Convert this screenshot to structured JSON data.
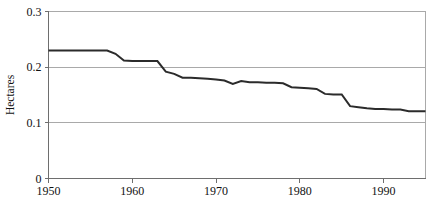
{
  "chart_data": {
    "type": "line",
    "title": "",
    "subtitle": "",
    "xlabel": "",
    "ylabel": "Hectares",
    "xlim": [
      1950,
      1995
    ],
    "ylim": [
      0,
      0.3
    ],
    "grid": true,
    "grid_axis": "y",
    "legend": false,
    "legend_position": "none",
    "xticks": [
      1950,
      1960,
      1970,
      1980,
      1990
    ],
    "xtick_labels": [
      "1950",
      "1960",
      "1970",
      "1980",
      "1990"
    ],
    "yticks": [
      0,
      0.1,
      0.2,
      0.3
    ],
    "ytick_labels": [
      "0",
      "0.1",
      "0.2",
      "0.3"
    ],
    "series": [
      {
        "name": "Grainland per person",
        "color": "#2b2b2b",
        "x": [
          1950,
          1951,
          1952,
          1953,
          1954,
          1955,
          1956,
          1957,
          1958,
          1959,
          1960,
          1961,
          1962,
          1963,
          1964,
          1965,
          1966,
          1967,
          1968,
          1969,
          1970,
          1971,
          1972,
          1973,
          1974,
          1975,
          1976,
          1977,
          1978,
          1979,
          1980,
          1981,
          1982,
          1983,
          1984,
          1985,
          1986,
          1987,
          1988,
          1989,
          1990,
          1991,
          1992,
          1993,
          1994,
          1995
        ],
        "values": [
          0.23,
          0.23,
          0.23,
          0.23,
          0.23,
          0.23,
          0.23,
          0.23,
          0.224,
          0.212,
          0.211,
          0.211,
          0.211,
          0.211,
          0.192,
          0.188,
          0.181,
          0.181,
          0.18,
          0.179,
          0.178,
          0.176,
          0.17,
          0.175,
          0.173,
          0.173,
          0.172,
          0.172,
          0.171,
          0.164,
          0.163,
          0.162,
          0.161,
          0.152,
          0.151,
          0.151,
          0.13,
          0.128,
          0.126,
          0.125,
          0.125,
          0.124,
          0.124,
          0.121,
          0.121,
          0.121
        ]
      }
    ]
  },
  "axes": {
    "y_title": "Hectares"
  }
}
